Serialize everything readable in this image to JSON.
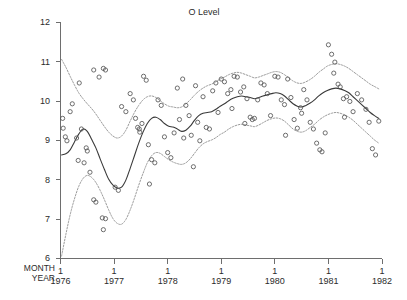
{
  "chart_data": {
    "type": "line",
    "title": "O Level",
    "xlabel": "",
    "ylabel": "",
    "grid": false,
    "legend": "none",
    "xlim": [
      1976.0,
      1982.0
    ],
    "ylim": [
      6,
      12
    ],
    "yticks": [
      6,
      7,
      8,
      9,
      10,
      11,
      12
    ],
    "yticklabels": [
      "6",
      "7",
      "8",
      "9",
      "10",
      "11",
      "12"
    ],
    "xticks": [
      1976,
      1977,
      1978,
      1979,
      1980,
      1981,
      1982
    ],
    "xtick_month_labels": [
      "1",
      "1",
      "1",
      "1",
      "1",
      "1",
      "1"
    ],
    "xtick_year_labels": [
      "1976",
      "1977",
      "1978",
      "1979",
      "1980",
      "1981",
      "1982"
    ],
    "axis_row_names": [
      "MONTH",
      "YEAR"
    ],
    "series": [
      {
        "name": "fitted",
        "style": "solid",
        "x": [
          1976.02,
          1976.1,
          1976.18,
          1976.26,
          1976.34,
          1976.42,
          1976.5,
          1976.58,
          1976.66,
          1976.74,
          1976.82,
          1976.9,
          1976.98,
          1977.06,
          1977.14,
          1977.22,
          1977.3,
          1977.38,
          1977.46,
          1977.54,
          1977.62,
          1977.7,
          1977.78,
          1977.86,
          1977.94,
          1978.02,
          1978.1,
          1978.18,
          1978.26,
          1978.34,
          1978.42,
          1978.5,
          1978.58,
          1978.66,
          1978.74,
          1978.82,
          1978.9,
          1978.98,
          1979.06,
          1979.14,
          1979.22,
          1979.3,
          1979.38,
          1979.46,
          1979.54,
          1979.62,
          1979.7,
          1979.78,
          1979.86,
          1979.94,
          1980.02,
          1980.1,
          1980.18,
          1980.26,
          1980.34,
          1980.42,
          1980.5,
          1980.58,
          1980.66,
          1980.74,
          1980.82,
          1980.9,
          1980.98,
          1981.06,
          1981.14,
          1981.22,
          1981.3,
          1981.38,
          1981.46,
          1981.54,
          1981.62,
          1981.7,
          1981.78,
          1981.86,
          1981.94
        ],
        "y": [
          8.62,
          8.65,
          8.75,
          8.95,
          9.15,
          9.28,
          9.22,
          9.02,
          8.8,
          8.52,
          8.25,
          8.0,
          7.85,
          7.78,
          7.8,
          7.98,
          8.28,
          8.6,
          8.92,
          9.2,
          9.42,
          9.55,
          9.58,
          9.52,
          9.42,
          9.35,
          9.33,
          9.28,
          9.22,
          9.25,
          9.35,
          9.5,
          9.62,
          9.68,
          9.7,
          9.72,
          9.78,
          9.86,
          9.92,
          10.0,
          10.06,
          10.1,
          10.12,
          10.1,
          10.08,
          10.05,
          10.08,
          10.12,
          10.15,
          10.18,
          10.2,
          10.18,
          10.12,
          10.02,
          9.92,
          9.86,
          9.84,
          9.88,
          9.94,
          10.02,
          10.12,
          10.2,
          10.26,
          10.3,
          10.32,
          10.3,
          10.26,
          10.2,
          10.1,
          10.0,
          9.9,
          9.8,
          9.7,
          9.62,
          9.55
        ]
      },
      {
        "name": "upper-band",
        "style": "dotted",
        "x": [
          1976.02,
          1976.1,
          1976.18,
          1976.26,
          1976.34,
          1976.42,
          1976.5,
          1976.58,
          1976.66,
          1976.74,
          1976.82,
          1976.9,
          1976.98,
          1977.06,
          1977.14,
          1977.22,
          1977.3,
          1977.38,
          1977.46,
          1977.54,
          1977.62,
          1977.7,
          1977.78,
          1977.86,
          1977.94,
          1978.02,
          1978.1,
          1978.18,
          1978.26,
          1978.34,
          1978.42,
          1978.5,
          1978.58,
          1978.66,
          1978.74,
          1978.82,
          1978.9,
          1978.98,
          1979.06,
          1979.14,
          1979.22,
          1979.3,
          1979.38,
          1979.46,
          1979.54,
          1979.62,
          1979.7,
          1979.78,
          1979.86,
          1979.94,
          1980.02,
          1980.1,
          1980.18,
          1980.26,
          1980.34,
          1980.42,
          1980.5,
          1980.58,
          1980.66,
          1980.74,
          1980.82,
          1980.9,
          1980.98,
          1981.06,
          1981.14,
          1981.22,
          1981.3,
          1981.38,
          1981.46,
          1981.54,
          1981.62,
          1981.7,
          1981.78,
          1981.86,
          1981.94
        ],
        "y": [
          11.05,
          10.85,
          10.62,
          10.4,
          10.2,
          10.05,
          9.92,
          9.8,
          9.66,
          9.5,
          9.34,
          9.2,
          9.1,
          9.05,
          9.1,
          9.25,
          9.48,
          9.7,
          9.88,
          10.02,
          10.1,
          10.12,
          10.08,
          10.0,
          9.92,
          9.86,
          9.84,
          9.82,
          9.84,
          9.92,
          10.02,
          10.14,
          10.24,
          10.32,
          10.38,
          10.42,
          10.48,
          10.55,
          10.6,
          10.66,
          10.7,
          10.72,
          10.7,
          10.66,
          10.62,
          10.58,
          10.6,
          10.64,
          10.68,
          10.72,
          10.74,
          10.72,
          10.66,
          10.58,
          10.5,
          10.45,
          10.44,
          10.48,
          10.54,
          10.62,
          10.72,
          10.8,
          10.88,
          10.92,
          10.94,
          10.92,
          10.88,
          10.82,
          10.74,
          10.66,
          10.58,
          10.5,
          10.42,
          10.36,
          10.3
        ]
      },
      {
        "name": "lower-band",
        "style": "dotted",
        "x": [
          1976.02,
          1976.1,
          1976.18,
          1976.26,
          1976.34,
          1976.42,
          1976.5,
          1976.58,
          1976.66,
          1976.74,
          1976.82,
          1976.9,
          1976.98,
          1977.06,
          1977.14,
          1977.22,
          1977.3,
          1977.38,
          1977.46,
          1977.54,
          1977.62,
          1977.7,
          1977.78,
          1977.86,
          1977.94,
          1978.02,
          1978.1,
          1978.18,
          1978.26,
          1978.34,
          1978.42,
          1978.5,
          1978.58,
          1978.66,
          1978.74,
          1978.82,
          1978.9,
          1978.98,
          1979.06,
          1979.14,
          1979.22,
          1979.3,
          1979.38,
          1979.46,
          1979.54,
          1979.62,
          1979.7,
          1979.78,
          1979.86,
          1979.94,
          1980.02,
          1980.1,
          1980.18,
          1980.26,
          1980.34,
          1980.42,
          1980.5,
          1980.58,
          1980.66,
          1980.74,
          1980.82,
          1980.9,
          1980.98,
          1981.06,
          1981.14,
          1981.22,
          1981.3,
          1981.38,
          1981.46,
          1981.54,
          1981.62,
          1981.7,
          1981.78,
          1981.86,
          1981.94
        ],
        "y": [
          6.05,
          6.6,
          7.1,
          7.5,
          7.82,
          8.02,
          8.1,
          8.05,
          7.92,
          7.72,
          7.48,
          7.22,
          7.0,
          6.88,
          6.86,
          6.98,
          7.22,
          7.52,
          7.85,
          8.15,
          8.42,
          8.6,
          8.68,
          8.66,
          8.58,
          8.5,
          8.44,
          8.4,
          8.38,
          8.42,
          8.52,
          8.66,
          8.8,
          8.9,
          8.96,
          9.0,
          9.06,
          9.14,
          9.2,
          9.28,
          9.34,
          9.38,
          9.4,
          9.38,
          9.36,
          9.34,
          9.38,
          9.44,
          9.5,
          9.54,
          9.56,
          9.54,
          9.48,
          9.38,
          9.28,
          9.22,
          9.2,
          9.24,
          9.32,
          9.4,
          9.5,
          9.58,
          9.64,
          9.68,
          9.7,
          9.68,
          9.64,
          9.58,
          9.5,
          9.4,
          9.3,
          9.2,
          9.1,
          9.0,
          8.92
        ]
      }
    ],
    "scatter": {
      "name": "observations",
      "marker": "open-circle",
      "points": [
        [
          1976.04,
          9.55
        ],
        [
          1976.05,
          9.3
        ],
        [
          1976.09,
          9.08
        ],
        [
          1976.12,
          8.98
        ],
        [
          1976.18,
          9.72
        ],
        [
          1976.22,
          9.92
        ],
        [
          1976.3,
          9.05
        ],
        [
          1976.33,
          8.48
        ],
        [
          1976.39,
          9.28
        ],
        [
          1976.44,
          8.42
        ],
        [
          1976.5,
          8.72
        ],
        [
          1976.55,
          8.18
        ],
        [
          1976.62,
          7.48
        ],
        [
          1976.66,
          7.42
        ],
        [
          1976.78,
          7.02
        ],
        [
          1976.84,
          7.0
        ],
        [
          1976.8,
          6.72
        ],
        [
          1976.62,
          10.78
        ],
        [
          1976.72,
          10.6
        ],
        [
          1976.8,
          10.82
        ],
        [
          1976.84,
          10.78
        ],
        [
          1977.02,
          7.8
        ],
        [
          1977.08,
          7.72
        ],
        [
          1977.14,
          9.85
        ],
        [
          1977.22,
          9.72
        ],
        [
          1977.36,
          10.02
        ],
        [
          1977.4,
          9.55
        ],
        [
          1977.44,
          9.32
        ],
        [
          1977.47,
          9.28
        ],
        [
          1977.48,
          9.2
        ],
        [
          1977.52,
          9.42
        ],
        [
          1977.55,
          10.62
        ],
        [
          1977.6,
          10.52
        ],
        [
          1977.64,
          8.88
        ],
        [
          1977.7,
          8.5
        ],
        [
          1977.76,
          8.42
        ],
        [
          1977.82,
          10.02
        ],
        [
          1977.88,
          9.88
        ],
        [
          1977.94,
          9.08
        ],
        [
          1978.0,
          8.68
        ],
        [
          1978.06,
          8.55
        ],
        [
          1978.12,
          9.18
        ],
        [
          1978.18,
          10.32
        ],
        [
          1978.22,
          9.52
        ],
        [
          1978.28,
          10.55
        ],
        [
          1978.34,
          9.88
        ],
        [
          1978.4,
          9.62
        ],
        [
          1978.44,
          9.12
        ],
        [
          1978.52,
          10.38
        ],
        [
          1978.56,
          9.45
        ],
        [
          1978.6,
          8.98
        ],
        [
          1978.66,
          10.1
        ],
        [
          1978.72,
          9.32
        ],
        [
          1978.78,
          9.28
        ],
        [
          1978.84,
          10.25
        ],
        [
          1978.9,
          10.45
        ],
        [
          1978.94,
          9.7
        ],
        [
          1979.0,
          10.55
        ],
        [
          1979.06,
          10.48
        ],
        [
          1979.12,
          10.18
        ],
        [
          1979.18,
          10.28
        ],
        [
          1979.24,
          10.62
        ],
        [
          1979.3,
          10.6
        ],
        [
          1979.36,
          10.22
        ],
        [
          1979.42,
          10.35
        ],
        [
          1979.48,
          10.05
        ],
        [
          1979.54,
          9.58
        ],
        [
          1979.58,
          9.52
        ],
        [
          1979.62,
          9.55
        ],
        [
          1979.68,
          10.02
        ],
        [
          1979.74,
          10.45
        ],
        [
          1979.8,
          10.4
        ],
        [
          1979.86,
          10.18
        ],
        [
          1979.92,
          9.62
        ],
        [
          1980.0,
          10.62
        ],
        [
          1980.06,
          10.6
        ],
        [
          1980.12,
          10.02
        ],
        [
          1980.18,
          9.9
        ],
        [
          1980.24,
          10.55
        ],
        [
          1980.3,
          10.08
        ],
        [
          1980.36,
          9.52
        ],
        [
          1980.42,
          9.3
        ],
        [
          1980.48,
          9.82
        ],
        [
          1980.54,
          10.28
        ],
        [
          1980.6,
          10.02
        ],
        [
          1980.66,
          9.45
        ],
        [
          1980.72,
          9.28
        ],
        [
          1980.78,
          8.92
        ],
        [
          1980.84,
          8.75
        ],
        [
          1980.88,
          8.7
        ],
        [
          1980.94,
          9.18
        ],
        [
          1981.0,
          11.42
        ],
        [
          1981.06,
          11.18
        ],
        [
          1981.12,
          10.98
        ],
        [
          1981.18,
          10.42
        ],
        [
          1981.22,
          10.35
        ],
        [
          1981.28,
          10.05
        ],
        [
          1981.34,
          10.1
        ],
        [
          1981.4,
          9.98
        ],
        [
          1981.46,
          9.72
        ],
        [
          1981.54,
          10.18
        ],
        [
          1981.62,
          10.02
        ],
        [
          1981.7,
          9.78
        ],
        [
          1981.76,
          9.45
        ],
        [
          1981.82,
          8.78
        ],
        [
          1981.88,
          8.62
        ],
        [
          1981.94,
          9.48
        ],
        [
          1976.35,
          10.45
        ],
        [
          1977.3,
          10.18
        ],
        [
          1978.3,
          9.05
        ],
        [
          1979.2,
          9.8
        ],
        [
          1980.2,
          9.12
        ],
        [
          1981.1,
          10.7
        ],
        [
          1976.48,
          8.8
        ],
        [
          1977.66,
          7.88
        ],
        [
          1978.48,
          8.32
        ],
        [
          1979.44,
          9.42
        ],
        [
          1980.5,
          9.68
        ],
        [
          1981.3,
          9.58
        ]
      ]
    }
  }
}
